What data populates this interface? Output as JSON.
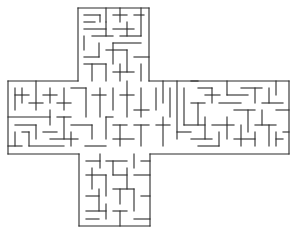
{
  "image": {
    "subject": "cross-shaped maze puzzle",
    "background": "#ffffff",
    "wall_color": "#2a2a2a"
  },
  "maze": {
    "regions": [
      {
        "name": "top-arm",
        "x": 78,
        "y": 8,
        "w": 71,
        "h": 73
      },
      {
        "name": "horizontal-band",
        "x": 8,
        "y": 81,
        "w": 281,
        "h": 73
      },
      {
        "name": "bottom-arm",
        "x": 79,
        "y": 154,
        "w": 71,
        "h": 72
      }
    ],
    "walls": [
      [
        78,
        8,
        78,
        81
      ],
      [
        149,
        8,
        149,
        81
      ],
      [
        78,
        8,
        149,
        8
      ],
      [
        8,
        81,
        78,
        81
      ],
      [
        149,
        81,
        289,
        81
      ],
      [
        8,
        81,
        8,
        154
      ],
      [
        289,
        81,
        289,
        154
      ],
      [
        8,
        154,
        79,
        154
      ],
      [
        150,
        154,
        289,
        154
      ],
      [
        79,
        154,
        79,
        226
      ],
      [
        150,
        154,
        150,
        226
      ],
      [
        79,
        226,
        150,
        226
      ],
      [
        84,
        15,
        100,
        15
      ],
      [
        100,
        15,
        100,
        22
      ],
      [
        84,
        22,
        95,
        22
      ],
      [
        106,
        8,
        106,
        22
      ],
      [
        113,
        15,
        127,
        15
      ],
      [
        120,
        8,
        120,
        22
      ],
      [
        134,
        15,
        144,
        15
      ],
      [
        141,
        8,
        141,
        36
      ],
      [
        84,
        29,
        106,
        29
      ],
      [
        106,
        22,
        106,
        36
      ],
      [
        113,
        29,
        134,
        29
      ],
      [
        127,
        22,
        127,
        36
      ],
      [
        92,
        36,
        113,
        36
      ],
      [
        84,
        36,
        84,
        50
      ],
      [
        120,
        36,
        141,
        36
      ],
      [
        99,
        43,
        99,
        57
      ],
      [
        113,
        43,
        141,
        43
      ],
      [
        113,
        43,
        113,
        64
      ],
      [
        84,
        57,
        99,
        57
      ],
      [
        106,
        50,
        127,
        50
      ],
      [
        127,
        50,
        127,
        72
      ],
      [
        134,
        57,
        149,
        57
      ],
      [
        141,
        64,
        141,
        81
      ],
      [
        84,
        64,
        106,
        64
      ],
      [
        92,
        64,
        92,
        81
      ],
      [
        106,
        64,
        106,
        81
      ],
      [
        113,
        72,
        134,
        72
      ],
      [
        120,
        64,
        120,
        81
      ],
      [
        15,
        88,
        15,
        110
      ],
      [
        15,
        95,
        29,
        95
      ],
      [
        22,
        88,
        22,
        103
      ],
      [
        36,
        81,
        36,
        110
      ],
      [
        29,
        103,
        43,
        103
      ],
      [
        50,
        88,
        50,
        103
      ],
      [
        43,
        95,
        57,
        95
      ],
      [
        64,
        88,
        64,
        110
      ],
      [
        57,
        103,
        71,
        103
      ],
      [
        71,
        88,
        86,
        88
      ],
      [
        86,
        88,
        86,
        117
      ],
      [
        92,
        95,
        106,
        95
      ],
      [
        100,
        88,
        100,
        117
      ],
      [
        113,
        88,
        113,
        110
      ],
      [
        120,
        95,
        134,
        95
      ],
      [
        127,
        81,
        127,
        117
      ],
      [
        141,
        88,
        141,
        117
      ],
      [
        134,
        110,
        149,
        110
      ],
      [
        8,
        117,
        50,
        117
      ],
      [
        50,
        110,
        50,
        125
      ],
      [
        15,
        125,
        36,
        125
      ],
      [
        36,
        125,
        36,
        139
      ],
      [
        57,
        117,
        71,
        117
      ],
      [
        64,
        117,
        64,
        139
      ],
      [
        71,
        125,
        92,
        125
      ],
      [
        92,
        125,
        92,
        139
      ],
      [
        106,
        117,
        113,
        117
      ],
      [
        106,
        117,
        106,
        139
      ],
      [
        113,
        125,
        127,
        125
      ],
      [
        120,
        125,
        120,
        146
      ],
      [
        134,
        125,
        149,
        125
      ],
      [
        141,
        125,
        141,
        146
      ],
      [
        15,
        132,
        15,
        146
      ],
      [
        22,
        132,
        29,
        132
      ],
      [
        29,
        132,
        29,
        146
      ],
      [
        43,
        132,
        57,
        132
      ],
      [
        50,
        139,
        78,
        139
      ],
      [
        71,
        132,
        71,
        146
      ],
      [
        85,
        146,
        106,
        146
      ],
      [
        113,
        139,
        134,
        139
      ],
      [
        8,
        146,
        22,
        146
      ],
      [
        29,
        146,
        64,
        146
      ],
      [
        156,
        88,
        156,
        110
      ],
      [
        163,
        81,
        163,
        103
      ],
      [
        170,
        88,
        170,
        117
      ],
      [
        177,
        81,
        177,
        139
      ],
      [
        184,
        88,
        184,
        125
      ],
      [
        191,
        81,
        198,
        81
      ],
      [
        198,
        88,
        212,
        88
      ],
      [
        212,
        88,
        212,
        103
      ],
      [
        205,
        95,
        220,
        95
      ],
      [
        227,
        81,
        227,
        95
      ],
      [
        227,
        95,
        248,
        95
      ],
      [
        241,
        88,
        262,
        88
      ],
      [
        255,
        88,
        255,
        103
      ],
      [
        269,
        88,
        269,
        103
      ],
      [
        276,
        81,
        276,
        95
      ],
      [
        262,
        103,
        283,
        103
      ],
      [
        191,
        103,
        205,
        103
      ],
      [
        198,
        103,
        198,
        125
      ],
      [
        219,
        103,
        241,
        103
      ],
      [
        234,
        110,
        255,
        110
      ],
      [
        248,
        110,
        248,
        132
      ],
      [
        262,
        110,
        262,
        125
      ],
      [
        276,
        110,
        289,
        110
      ],
      [
        156,
        125,
        170,
        125
      ],
      [
        163,
        117,
        163,
        146
      ],
      [
        177,
        132,
        191,
        132
      ],
      [
        184,
        125,
        205,
        125
      ],
      [
        205,
        117,
        205,
        139
      ],
      [
        212,
        125,
        234,
        125
      ],
      [
        227,
        117,
        227,
        139
      ],
      [
        241,
        125,
        241,
        146
      ],
      [
        255,
        125,
        276,
        125
      ],
      [
        269,
        125,
        269,
        146
      ],
      [
        283,
        132,
        289,
        132
      ],
      [
        191,
        139,
        212,
        139
      ],
      [
        198,
        146,
        219,
        146
      ],
      [
        219,
        132,
        219,
        146
      ],
      [
        234,
        139,
        255,
        139
      ],
      [
        255,
        132,
        255,
        146
      ],
      [
        276,
        139,
        283,
        139
      ],
      [
        276,
        132,
        276,
        146
      ],
      [
        86,
        161,
        100,
        161
      ],
      [
        100,
        154,
        100,
        168
      ],
      [
        106,
        161,
        127,
        161
      ],
      [
        113,
        161,
        113,
        175
      ],
      [
        134,
        154,
        134,
        168
      ],
      [
        141,
        161,
        150,
        161
      ],
      [
        86,
        175,
        106,
        175
      ],
      [
        92,
        168,
        92,
        189
      ],
      [
        106,
        175,
        106,
        196
      ],
      [
        113,
        175,
        127,
        175
      ],
      [
        127,
        168,
        127,
        189
      ],
      [
        134,
        175,
        150,
        175
      ],
      [
        86,
        196,
        99,
        196
      ],
      [
        99,
        189,
        99,
        211
      ],
      [
        113,
        189,
        134,
        189
      ],
      [
        120,
        189,
        120,
        204
      ],
      [
        134,
        189,
        134,
        211
      ],
      [
        141,
        196,
        150,
        196
      ],
      [
        86,
        211,
        106,
        211
      ],
      [
        106,
        204,
        106,
        219
      ],
      [
        113,
        211,
        127,
        211
      ],
      [
        120,
        211,
        120,
        226
      ],
      [
        134,
        219,
        150,
        219
      ],
      [
        86,
        219,
        99,
        219
      ]
    ]
  }
}
